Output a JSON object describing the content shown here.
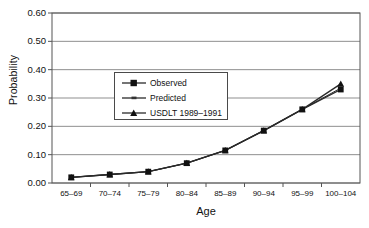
{
  "chart_data": {
    "type": "line",
    "title": "",
    "xlabel": "Age",
    "ylabel": "Probability",
    "categories": [
      "65–69",
      "70–74",
      "75–79",
      "80–84",
      "85–89",
      "90–94",
      "95–99",
      "100–104"
    ],
    "ylim": [
      0.0,
      0.6
    ],
    "yticks": [
      "0.00",
      "0.10",
      "0.20",
      "0.30",
      "0.40",
      "0.50",
      "0.60"
    ],
    "ytick_values": [
      0.0,
      0.1,
      0.2,
      0.3,
      0.4,
      0.5,
      0.6
    ],
    "grid": "horizontal",
    "legend_position": "upper-left-inside",
    "series": [
      {
        "name": "Observed",
        "marker": "square",
        "values": [
          0.02,
          0.03,
          0.04,
          0.07,
          0.115,
          0.185,
          0.26,
          0.33
        ]
      },
      {
        "name": "Predicted",
        "marker": "none",
        "values": [
          0.02,
          0.03,
          0.04,
          0.07,
          0.115,
          0.185,
          0.26,
          0.335
        ]
      },
      {
        "name": "USDLT 1989–1991",
        "marker": "triangle",
        "values": [
          0.02,
          0.03,
          0.04,
          0.07,
          0.115,
          0.185,
          0.26,
          0.35
        ]
      }
    ]
  },
  "legend": {
    "items": [
      {
        "label": "Observed",
        "marker": "square-marker"
      },
      {
        "label": "Predicted",
        "marker": "line-marker"
      },
      {
        "label": "USDLT 1989–1991",
        "marker": "triangle-marker"
      }
    ]
  },
  "colors": {
    "line": "#2a2a2a",
    "grid": "#8f8f8f",
    "axis": "#555555",
    "background": "#ffffff"
  }
}
